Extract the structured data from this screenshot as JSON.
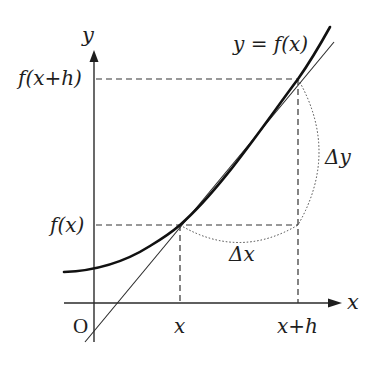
{
  "figure": {
    "labels": {
      "y_axis": "y",
      "x_axis": "x",
      "origin": "O",
      "curve": "y = f(x)",
      "fx": "f(x)",
      "fxh": "f(x+h)",
      "x_tick": "x",
      "xh_tick": "x+h",
      "delta_x": "Δx",
      "delta_y": "Δy"
    },
    "colors": {
      "ink": "#1e1e1e",
      "background": "#ffffff"
    }
  }
}
